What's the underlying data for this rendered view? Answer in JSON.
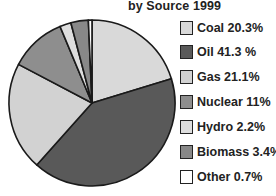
{
  "title": "by Source 1999",
  "chart_data": {
    "type": "pie",
    "title": "by Source 1999",
    "categories": [
      "Coal",
      "Oil",
      "Gas",
      "Nuclear",
      "Hydro",
      "Biomass",
      "Other"
    ],
    "values": [
      20.3,
      41.3,
      21.1,
      11,
      2.2,
      3.4,
      0.7
    ],
    "colors": [
      "#d9d9d9",
      "#595959",
      "#d2d2d2",
      "#8e8e8e",
      "#dedede",
      "#888888",
      "#ffffff"
    ],
    "start_angle": "12 o'clock",
    "direction": "clockwise",
    "legend_position": "right"
  },
  "legend": [
    {
      "label": "Coal 20.3%",
      "color": "#d9d9d9"
    },
    {
      "label": "Oil 41.3 %",
      "color": "#595959"
    },
    {
      "label": "Gas 21.1%",
      "color": "#d2d2d2"
    },
    {
      "label": "Nuclear 11%",
      "color": "#8e8e8e"
    },
    {
      "label": "Hydro 2.2%",
      "color": "#dedede"
    },
    {
      "label": "Biomass 3.4%",
      "color": "#888888"
    },
    {
      "label": "Other 0.7%",
      "color": "#ffffff"
    }
  ]
}
